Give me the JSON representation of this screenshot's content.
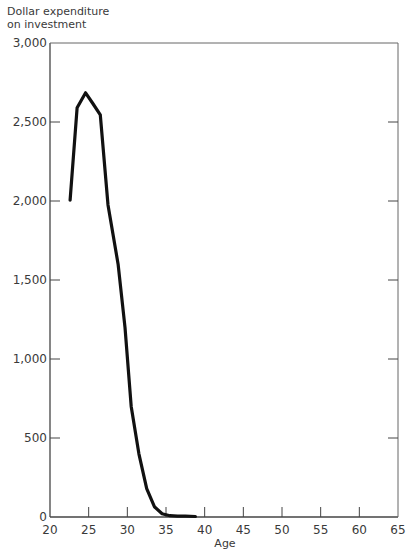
{
  "chart_data": {
    "type": "line",
    "title": "",
    "ylabel_lines": [
      "Dollar expenditure",
      "on investment"
    ],
    "xlabel": "Age",
    "xlim": [
      20,
      65
    ],
    "ylim": [
      0,
      3000
    ],
    "xticks": [
      20,
      25,
      30,
      35,
      40,
      45,
      50,
      55,
      60,
      65
    ],
    "xtick_labels": [
      "20",
      "25",
      "30",
      "35",
      "40",
      "45",
      "50",
      "55",
      "60",
      "65"
    ],
    "yticks": [
      0,
      500,
      1000,
      1500,
      2000,
      2500,
      3000
    ],
    "ytick_labels": [
      "0",
      "500",
      "1,000",
      "1,500",
      "2,000",
      "2,500",
      "3,000"
    ],
    "grid": false,
    "legend": "none",
    "series": [
      {
        "name": "Dollar expenditure on investment",
        "color": "#111111",
        "x": [
          22.6,
          23.5,
          24.6,
          25.5,
          26.5,
          27.5,
          28.8,
          29.7,
          30.5,
          31.5,
          32.5,
          33.5,
          34.5,
          35.5,
          36.5,
          37.5,
          38.8
        ],
        "y": [
          2005,
          2590,
          2685,
          2620,
          2545,
          1975,
          1600,
          1200,
          700,
          400,
          180,
          65,
          20,
          8,
          6,
          5,
          3
        ]
      }
    ]
  }
}
